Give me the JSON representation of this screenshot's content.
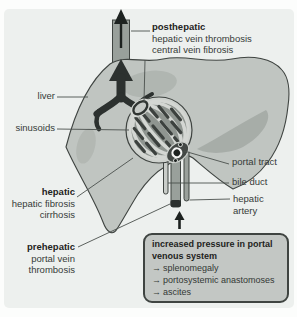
{
  "figure": {
    "labels": {
      "posthepatic": {
        "title": "posthepatic",
        "line1": "hepatic vein thrombosis",
        "line2": "central vein fibrosis"
      },
      "liver": "liver",
      "sinusoids": "sinusoids",
      "hepatic": {
        "title": "hepatic",
        "line1": "hepatic fibrosis",
        "line2": "cirrhosis"
      },
      "prehepatic": {
        "title": "prehepatic",
        "line1": "portal vein",
        "line2": "thrombosis"
      },
      "portal_tract": "portal tract",
      "bile_duct": "bile duct",
      "hepatic_artery_line1": "hepatic",
      "hepatic_artery_line2": "artery"
    },
    "info_box": {
      "title_line1": "increased pressure in portal",
      "title_line2": "venous system",
      "arrow_glyph": "→",
      "items": [
        "splenomegaly",
        "portosystemic anastomoses",
        "ascites"
      ]
    },
    "colors": {
      "panel_bg": "#edf0ee",
      "liver_fill": "#c0c5c1",
      "lobule_inner": "#8f9590",
      "lobule_band": "#d4d7d3",
      "dark_vessel": "#2c312f",
      "info_box_bg": "#c3c7c4",
      "outline": "#3f4441"
    }
  }
}
